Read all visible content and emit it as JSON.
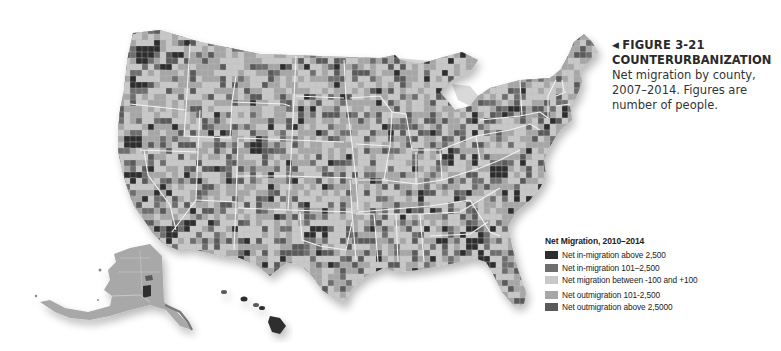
{
  "figure": {
    "number": "FIGURE 3-21",
    "arrow_icon": "◀",
    "title": "COUNTERURBANIZATION",
    "description_lines": [
      "Net migration by county,",
      "2007–2014. Figures are",
      "number of people."
    ]
  },
  "legend": {
    "title": "Net Migration, 2010–2014",
    "items": [
      {
        "label": "Net in-migration above 2,500",
        "color": "#2e2e2e"
      },
      {
        "label": "Net in-migration 101–2,500",
        "color": "#6e6e6e"
      },
      {
        "label": "Net migration between -100 and +100",
        "color": "#c8c8c8"
      },
      {
        "label": "Net outmigration 101-2,500",
        "color": "#a6a6a6"
      },
      {
        "label": "Net outmigration above 2,5000",
        "color": "#5a5a5a"
      }
    ]
  },
  "map": {
    "region": "United States (counties)",
    "insets": [
      "Alaska",
      "Hawaii"
    ],
    "colors": {
      "in_high": "#2e2e2e",
      "in_mid": "#6e6e6e",
      "neutral": "#c8c8c8",
      "out_mid": "#a6a6a6",
      "out_high": "#5a5a5a",
      "state_border": "#f4f4f4",
      "water": "#d9d9d9"
    }
  }
}
